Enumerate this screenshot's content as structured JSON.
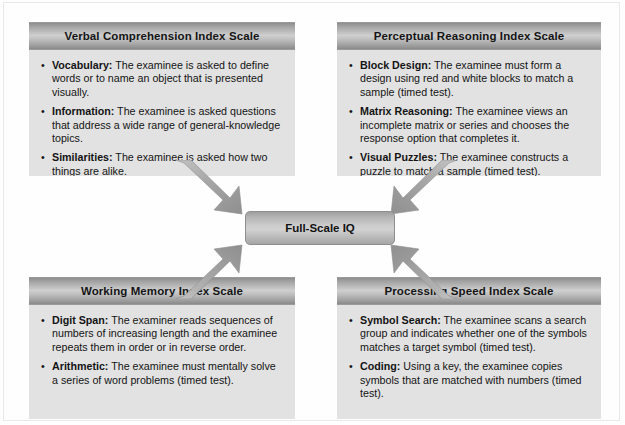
{
  "diagram": {
    "type": "converging-block-diagram",
    "center": {
      "label": "Full-Scale IQ",
      "name": "full-scale-iq-node"
    },
    "arrows": [
      {
        "name": "arrow-vci-to-center",
        "from": "Verbal Comprehension Index Scale",
        "to": "Full-Scale IQ",
        "direction": "down-right"
      },
      {
        "name": "arrow-pri-to-center",
        "from": "Perceptual Reasoning Index Scale",
        "to": "Full-Scale IQ",
        "direction": "down-left"
      },
      {
        "name": "arrow-wmi-to-center",
        "from": "Working Memory Index Scale",
        "to": "Full-Scale IQ",
        "direction": "up-right"
      },
      {
        "name": "arrow-psi-to-center",
        "from": "Processing Speed Index Scale",
        "to": "Full-Scale IQ",
        "direction": "up-left"
      }
    ],
    "bullet_glyph": "•",
    "colors": {
      "box_body": "#e2e2e2",
      "header_light": "#cfcfcf",
      "header_dark": "#8a8a8a",
      "arrow_fill": "#a9a9a9",
      "text": "#141414"
    }
  },
  "boxes": {
    "vci": {
      "title": "Verbal Comprehension Index Scale",
      "items": [
        {
          "term": "Vocabulary:",
          "text": " The examinee is asked to define words or to name an object that is presented visually."
        },
        {
          "term": "Information:",
          "text": " The examinee is asked questions that address a wide range of general-knowledge topics."
        },
        {
          "term": "Similarities:",
          "text": " The examinee is asked how two things are alike."
        }
      ]
    },
    "pri": {
      "title": "Perceptual Reasoning Index Scale",
      "items": [
        {
          "term": "Block Design:",
          "text": " The examinee must form a design using red and white blocks to match a sample (timed test)."
        },
        {
          "term": "Matrix Reasoning:",
          "text": " The examinee views an incomplete matrix or series and chooses the response option that completes it."
        },
        {
          "term": "Visual Puzzles:",
          "text": " The examinee constructs a puzzle to match a sample (timed test)."
        }
      ]
    },
    "wmi": {
      "title": "Working Memory Index Scale",
      "items": [
        {
          "term": "Digit Span:",
          "text": " The examiner reads sequences of numbers of increasing length and the examinee repeats them in order or in reverse order."
        },
        {
          "term": "Arithmetic:",
          "text": " The examinee must mentally solve a series of word problems (timed test)."
        }
      ]
    },
    "psi": {
      "title": "Processing Speed Index Scale",
      "items": [
        {
          "term": "Symbol Search:",
          "text": " The examinee scans a search group and indicates whether one of the symbols matches a target symbol (timed test)."
        },
        {
          "term": "Coding:",
          "text": " Using a key, the examinee copies symbols that are matched with numbers (timed test)."
        }
      ]
    }
  }
}
